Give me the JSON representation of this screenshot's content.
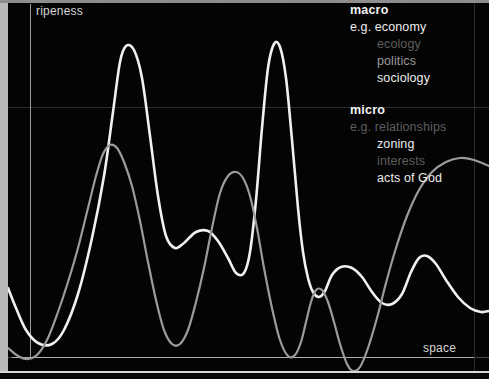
{
  "axes": {
    "y_label": "ripeness",
    "x_label": "space"
  },
  "legend": {
    "macro": {
      "heading": "macro",
      "items": [
        {
          "text": "e.g. economy",
          "level": "bright",
          "indent": false
        },
        {
          "text": "ecology",
          "level": "dim",
          "indent": true
        },
        {
          "text": "politics",
          "level": "mid",
          "indent": true
        },
        {
          "text": "sociology",
          "level": "bright",
          "indent": true
        }
      ]
    },
    "micro": {
      "heading": "micro",
      "items": [
        {
          "text": "e.g. relationships",
          "level": "dim",
          "indent": false
        },
        {
          "text": "zoning",
          "level": "bright",
          "indent": true
        },
        {
          "text": "interests",
          "level": "dim",
          "indent": true
        },
        {
          "text": "acts of God",
          "level": "bright",
          "indent": true
        }
      ]
    }
  },
  "colors": {
    "background": "#040404",
    "frame": "#b9b9b9",
    "axis": "#b0b0b0",
    "gridline": "#2c2c2c",
    "curve_macro": "#f0f0f0",
    "curve_micro": "#9b9b9b",
    "text_bright": "#ededed",
    "text_mid": "#9a9a9a",
    "text_dim": "#5d5d5d"
  },
  "chart_data": {
    "type": "line",
    "title": "",
    "xlabel": "space",
    "ylabel": "ripeness",
    "xlim": [
      0,
      489
    ],
    "ylim": [
      379,
      0
    ],
    "grid": true,
    "legend_position": "top-right",
    "annotations": [
      "macro: e.g. economy, ecology, politics, sociology",
      "micro: e.g. relationships, zoning, interests, acts of God"
    ],
    "series": [
      {
        "name": "macro",
        "color": "#f0f0f0",
        "width": 2.6,
        "points": [
          [
            8,
            288
          ],
          [
            16,
            308
          ],
          [
            26,
            330
          ],
          [
            38,
            343
          ],
          [
            52,
            344
          ],
          [
            64,
            330
          ],
          [
            78,
            294
          ],
          [
            92,
            238
          ],
          [
            104,
            176
          ],
          [
            113,
            112
          ],
          [
            120,
            62
          ],
          [
            126,
            46
          ],
          [
            134,
            50
          ],
          [
            142,
            78
          ],
          [
            150,
            136
          ],
          [
            158,
            196
          ],
          [
            166,
            236
          ],
          [
            175,
            248
          ],
          [
            184,
            243
          ],
          [
            196,
            232
          ],
          [
            208,
            231
          ],
          [
            218,
            241
          ],
          [
            228,
            258
          ],
          [
            236,
            273
          ],
          [
            244,
            273
          ],
          [
            250,
            252
          ],
          [
            256,
            200
          ],
          [
            262,
            128
          ],
          [
            268,
            68
          ],
          [
            274,
            44
          ],
          [
            280,
            47
          ],
          [
            286,
            78
          ],
          [
            292,
            140
          ],
          [
            298,
            208
          ],
          [
            303,
            252
          ],
          [
            308,
            278
          ],
          [
            313,
            292
          ],
          [
            319,
            297
          ],
          [
            325,
            291
          ],
          [
            332,
            275
          ],
          [
            341,
            267
          ],
          [
            352,
            268
          ],
          [
            362,
            277
          ],
          [
            372,
            292
          ],
          [
            382,
            303
          ],
          [
            392,
            304
          ],
          [
            402,
            294
          ],
          [
            411,
            272
          ],
          [
            419,
            258
          ],
          [
            427,
            256
          ],
          [
            436,
            264
          ],
          [
            446,
            280
          ],
          [
            458,
            297
          ],
          [
            470,
            308
          ],
          [
            481,
            312
          ],
          [
            489,
            311
          ]
        ]
      },
      {
        "name": "micro",
        "color": "#9b9b9b",
        "width": 2.2,
        "points": [
          [
            8,
            348
          ],
          [
            18,
            356
          ],
          [
            28,
            359
          ],
          [
            38,
            354
          ],
          [
            48,
            338
          ],
          [
            58,
            312
          ],
          [
            68,
            282
          ],
          [
            78,
            248
          ],
          [
            88,
            208
          ],
          [
            96,
            176
          ],
          [
            103,
            154
          ],
          [
            110,
            145
          ],
          [
            117,
            148
          ],
          [
            124,
            162
          ],
          [
            132,
            186
          ],
          [
            140,
            221
          ],
          [
            148,
            262
          ],
          [
            156,
            300
          ],
          [
            164,
            330
          ],
          [
            172,
            344
          ],
          [
            180,
            344
          ],
          [
            188,
            330
          ],
          [
            196,
            302
          ],
          [
            204,
            268
          ],
          [
            212,
            228
          ],
          [
            220,
            193
          ],
          [
            228,
            176
          ],
          [
            236,
            172
          ],
          [
            243,
            178
          ],
          [
            250,
            196
          ],
          [
            257,
            228
          ],
          [
            264,
            268
          ],
          [
            272,
            308
          ],
          [
            280,
            340
          ],
          [
            288,
            356
          ],
          [
            295,
            355
          ],
          [
            301,
            342
          ],
          [
            306,
            322
          ],
          [
            311,
            302
          ],
          [
            316,
            290
          ],
          [
            322,
            290
          ],
          [
            328,
            302
          ],
          [
            334,
            322
          ],
          [
            340,
            344
          ],
          [
            347,
            364
          ],
          [
            353,
            371
          ],
          [
            360,
            367
          ],
          [
            368,
            348
          ],
          [
            377,
            318
          ],
          [
            386,
            283
          ],
          [
            396,
            248
          ],
          [
            407,
            216
          ],
          [
            419,
            190
          ],
          [
            432,
            172
          ],
          [
            446,
            162
          ],
          [
            460,
            158
          ],
          [
            474,
            160
          ],
          [
            489,
            166
          ]
        ]
      }
    ]
  }
}
